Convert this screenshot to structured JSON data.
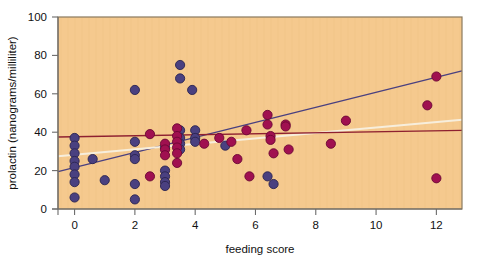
{
  "chart_data": {
    "type": "scatter",
    "title": "",
    "xlabel": "feeding score",
    "ylabel": "prolactin (nanograms/milliliter)",
    "xlim": [
      -0.55,
      12.85
    ],
    "ylim": [
      0,
      100
    ],
    "xticks": [
      0,
      2,
      4,
      6,
      8,
      10,
      12
    ],
    "xticklabels": [
      "0",
      "2",
      "4",
      "6",
      "8",
      "10",
      "12"
    ],
    "yticks": [
      0,
      20,
      40,
      60,
      80,
      100
    ],
    "yticklabels": [
      "0",
      "20",
      "40",
      "60",
      "80",
      "100"
    ],
    "grid": false,
    "legend": "none",
    "plot_background": "#F5C98E",
    "series": [
      {
        "name": "blue-group",
        "marker": "circle",
        "color": "#4A4080",
        "edge_color": "#2A2450",
        "points": [
          [
            0,
            37
          ],
          [
            0,
            33
          ],
          [
            0,
            29
          ],
          [
            0,
            25
          ],
          [
            0,
            22
          ],
          [
            0,
            18
          ],
          [
            0,
            14
          ],
          [
            0,
            6
          ],
          [
            0.6,
            26
          ],
          [
            1.0,
            15
          ],
          [
            2.0,
            62
          ],
          [
            2.0,
            35
          ],
          [
            2.0,
            28
          ],
          [
            2.0,
            26
          ],
          [
            2.0,
            13
          ],
          [
            2.0,
            5
          ],
          [
            3.0,
            32
          ],
          [
            3.0,
            20
          ],
          [
            3.0,
            17
          ],
          [
            3.0,
            14
          ],
          [
            3.0,
            12
          ],
          [
            3.5,
            75
          ],
          [
            3.5,
            68
          ],
          [
            3.5,
            41
          ],
          [
            3.5,
            37
          ],
          [
            3.5,
            34
          ],
          [
            3.5,
            31
          ],
          [
            3.9,
            62
          ],
          [
            4.0,
            41
          ],
          [
            4.0,
            37
          ],
          [
            4.0,
            35
          ],
          [
            5.0,
            33
          ],
          [
            6.4,
            17
          ],
          [
            6.6,
            13
          ]
        ]
      },
      {
        "name": "red-group",
        "marker": "circle",
        "color": "#A01050",
        "edge_color": "#6A0733",
        "points": [
          [
            2.5,
            39
          ],
          [
            2.5,
            17
          ],
          [
            3.0,
            34
          ],
          [
            3.0,
            31
          ],
          [
            3.0,
            28
          ],
          [
            3.4,
            42
          ],
          [
            3.4,
            38
          ],
          [
            3.4,
            35
          ],
          [
            3.4,
            32
          ],
          [
            3.4,
            29
          ],
          [
            3.4,
            24
          ],
          [
            4.3,
            34
          ],
          [
            4.8,
            37
          ],
          [
            5.2,
            35
          ],
          [
            5.4,
            26
          ],
          [
            5.7,
            41
          ],
          [
            5.8,
            17
          ],
          [
            6.4,
            49
          ],
          [
            6.4,
            44
          ],
          [
            6.5,
            38
          ],
          [
            6.5,
            36
          ],
          [
            6.6,
            29
          ],
          [
            7.0,
            44
          ],
          [
            7.0,
            43
          ],
          [
            7.1,
            31
          ],
          [
            8.5,
            34
          ],
          [
            9.0,
            46
          ],
          [
            11.7,
            54
          ],
          [
            12.0,
            69
          ],
          [
            12.0,
            16
          ]
        ]
      }
    ],
    "lines": [
      {
        "name": "blue-regression",
        "color": "#4A4080",
        "width": 1.3,
        "x1": -0.55,
        "y1": 19.5,
        "x2": 12.85,
        "y2": 72.0
      },
      {
        "name": "cream-regression",
        "color": "#F7EEDC",
        "width": 2.0,
        "x1": -0.55,
        "y1": 27.5,
        "x2": 12.85,
        "y2": 46.5
      },
      {
        "name": "red-regression",
        "color": "#8E2030",
        "width": 1.3,
        "x1": -0.55,
        "y1": 37.5,
        "x2": 12.85,
        "y2": 41.0
      }
    ]
  }
}
